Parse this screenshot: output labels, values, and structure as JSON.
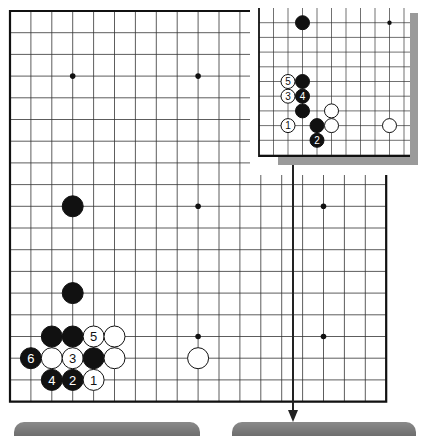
{
  "diagram": {
    "type": "go-problem",
    "main_board": {
      "origin": {
        "x": 10,
        "y": 11
      },
      "spacing": {
        "x": 20.9,
        "y": 21.7
      },
      "cols": 19,
      "rows": 19,
      "star_points": [
        [
          3,
          3
        ],
        [
          9,
          3
        ],
        [
          3,
          9
        ],
        [
          9,
          9
        ],
        [
          15,
          9
        ],
        [
          9,
          15
        ],
        [
          15,
          15
        ]
      ],
      "stones": [
        {
          "col": 3,
          "row": 9,
          "color": "black",
          "label": ""
        },
        {
          "col": 3,
          "row": 13,
          "color": "black",
          "label": ""
        },
        {
          "col": 2,
          "row": 15,
          "color": "black",
          "label": ""
        },
        {
          "col": 3,
          "row": 15,
          "color": "black",
          "label": ""
        },
        {
          "col": 4,
          "row": 15,
          "color": "white",
          "label": "5"
        },
        {
          "col": 5,
          "row": 15,
          "color": "white",
          "label": ""
        },
        {
          "col": 1,
          "row": 16,
          "color": "black",
          "label": "6"
        },
        {
          "col": 2,
          "row": 16,
          "color": "white",
          "label": ""
        },
        {
          "col": 3,
          "row": 16,
          "color": "white",
          "label": "3"
        },
        {
          "col": 4,
          "row": 16,
          "color": "black",
          "label": ""
        },
        {
          "col": 5,
          "row": 16,
          "color": "white",
          "label": ""
        },
        {
          "col": 9,
          "row": 16,
          "color": "white",
          "label": ""
        },
        {
          "col": 2,
          "row": 17,
          "color": "black",
          "label": "4"
        },
        {
          "col": 3,
          "row": 17,
          "color": "black",
          "label": "2"
        },
        {
          "col": 4,
          "row": 17,
          "color": "white",
          "label": "1"
        }
      ]
    },
    "inset_board": {
      "origin": {
        "x": 259,
        "y": 8
      },
      "spacing": {
        "x": 14.5,
        "y": 14.7
      },
      "star_points": [
        [
          9,
          1
        ],
        [
          9,
          8
        ]
      ],
      "stones": [
        {
          "col": 3,
          "row": 1,
          "color": "black",
          "label": ""
        },
        {
          "col": 2,
          "row": 5,
          "color": "white",
          "label": "5"
        },
        {
          "col": 3,
          "row": 5,
          "color": "black",
          "label": ""
        },
        {
          "col": 2,
          "row": 6,
          "color": "white",
          "label": "3"
        },
        {
          "col": 3,
          "row": 6,
          "color": "black",
          "label": "4"
        },
        {
          "col": 3,
          "row": 7,
          "color": "black",
          "label": ""
        },
        {
          "col": 5,
          "row": 7,
          "color": "white",
          "label": ""
        },
        {
          "col": 2,
          "row": 8,
          "color": "white",
          "label": "1"
        },
        {
          "col": 4,
          "row": 8,
          "color": "black",
          "label": ""
        },
        {
          "col": 5,
          "row": 8,
          "color": "white",
          "label": ""
        },
        {
          "col": 9,
          "row": 8,
          "color": "white",
          "label": ""
        },
        {
          "col": 4,
          "row": 9,
          "color": "black",
          "label": "2"
        }
      ]
    },
    "colors": {
      "line": "#333333",
      "edge": "#111111",
      "shadow": "#9a9a9a",
      "bar": "#7a7a7a"
    }
  }
}
